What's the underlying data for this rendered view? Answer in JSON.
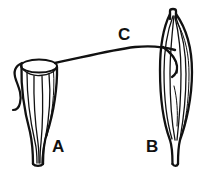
{
  "figure": {
    "background_color": "#ffffff",
    "ink_color": "#111111",
    "width": 209,
    "height": 176
  },
  "labels": [
    {
      "id": "label-a",
      "text": "A",
      "x": 52,
      "y": 152,
      "describes": "left cup-shaped structure with open rim and tapering stalk"
    },
    {
      "id": "label-b",
      "text": "B",
      "x": 146,
      "y": 152,
      "describes": "right spindle-shaped (fusiform) ribbed structure with narrow stalk"
    },
    {
      "id": "label-c",
      "text": "C",
      "x": 118,
      "y": 40,
      "describes": "curved connector line joining the rim of A to the body of B"
    }
  ],
  "parts": {
    "structure_a": {
      "name": "structure-a",
      "label": "A",
      "form": "open cup on a tapering stalk",
      "features": [
        "elliptical open rim",
        "longitudinal ribs",
        "side hook",
        "narrow base stalk"
      ],
      "rib_count": 5
    },
    "structure_b": {
      "name": "structure-b",
      "label": "B",
      "form": "fusiform spindle on a narrow stalk",
      "features": [
        "flat apical tip",
        "longitudinal ribs",
        "internal hook",
        "narrow basal stalk"
      ],
      "rib_count": 5
    },
    "connector_c": {
      "name": "connector-c",
      "label": "C",
      "form": "single arcing line",
      "from": "rim of structure A",
      "to": "upper body of structure B"
    }
  }
}
